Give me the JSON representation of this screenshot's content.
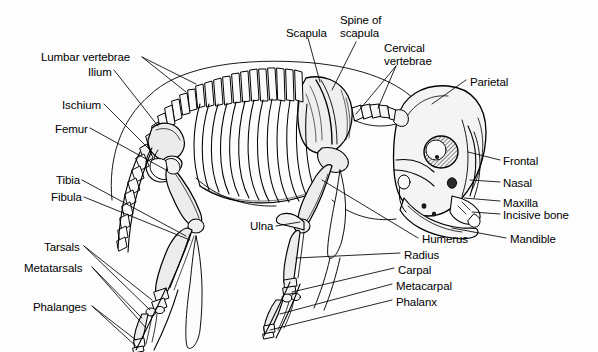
{
  "figure": {
    "view": "lateral-left",
    "background_color": "#fdfdfd",
    "line_color": "#000000",
    "bone_fill_light": "#ffffff",
    "bone_fill_shaded": "#ececec",
    "label_font_size_px": 11.5
  },
  "labels": {
    "lumbar_vertebrae": "Lumbar vertebrae",
    "ilium": "Ilium",
    "ischium": "Ischium",
    "femur": "Femur",
    "tibia": "Tibia",
    "fibula": "Fibula",
    "tarsals": "Tarsals",
    "metatarsals": "Metatarsals",
    "phalanges": "Phalanges",
    "scapula": "Scapula",
    "spine_of_scapula_line1": "Spine of",
    "spine_of_scapula_line2": "scapula",
    "cervical_vertebrae_line1": "Cervical",
    "cervical_vertebrae_line2": "vertebrae",
    "parietal": "Parietal",
    "frontal": "Frontal",
    "nasal": "Nasal",
    "maxilla": "Maxilla",
    "incisive_bone": "Incisive bone",
    "mandible": "Mandible",
    "ulna": "Ulna",
    "humerus": "Humerus",
    "radius": "Radius",
    "carpal": "Carpal",
    "metacarpal": "Metacarpal",
    "phalanx": "Phalanx"
  },
  "label_positions": {
    "lumbar_vertebrae": {
      "x": 41,
      "y": 51,
      "align": "left"
    },
    "ilium": {
      "x": 88,
      "y": 66,
      "align": "left"
    },
    "ischium": {
      "x": 62,
      "y": 99,
      "align": "left"
    },
    "femur": {
      "x": 55,
      "y": 123,
      "align": "left"
    },
    "tibia": {
      "x": 56,
      "y": 174,
      "align": "left"
    },
    "fibula": {
      "x": 51,
      "y": 191,
      "align": "left"
    },
    "tarsals": {
      "x": 44,
      "y": 241,
      "align": "left"
    },
    "metatarsals": {
      "x": 24,
      "y": 262,
      "align": "left"
    },
    "phalanges": {
      "x": 33,
      "y": 301,
      "align": "left"
    },
    "scapula": {
      "x": 286,
      "y": 27,
      "align": "left"
    },
    "spine_of_scapula": {
      "x": 340,
      "y": 14,
      "align": "left"
    },
    "cervical_vertebrae": {
      "x": 384,
      "y": 42,
      "align": "left"
    },
    "parietal": {
      "x": 470,
      "y": 76,
      "align": "left"
    },
    "frontal": {
      "x": 503,
      "y": 155,
      "align": "left"
    },
    "nasal": {
      "x": 503,
      "y": 177,
      "align": "left"
    },
    "maxilla": {
      "x": 503,
      "y": 197,
      "align": "left"
    },
    "incisive_bone": {
      "x": 503,
      "y": 209,
      "align": "left"
    },
    "mandible": {
      "x": 510,
      "y": 233,
      "align": "left"
    },
    "ulna": {
      "x": 250,
      "y": 220,
      "align": "left"
    },
    "humerus": {
      "x": 422,
      "y": 233,
      "align": "left"
    },
    "radius": {
      "x": 404,
      "y": 249,
      "align": "left"
    },
    "carpal": {
      "x": 398,
      "y": 264,
      "align": "left"
    },
    "metacarpal": {
      "x": 396,
      "y": 280,
      "align": "left"
    },
    "phalanx": {
      "x": 396,
      "y": 296,
      "align": "left"
    }
  },
  "bone_groups": [
    {
      "name": "skull",
      "label_refs": [
        "parietal",
        "frontal",
        "nasal",
        "maxilla",
        "incisive_bone",
        "mandible"
      ]
    },
    {
      "name": "vertebral-column",
      "label_refs": [
        "cervical_vertebrae",
        "lumbar_vertebrae"
      ]
    },
    {
      "name": "ribcage",
      "label_refs": []
    },
    {
      "name": "pectoral-girdle",
      "label_refs": [
        "scapula",
        "spine_of_scapula"
      ]
    },
    {
      "name": "forelimb",
      "label_refs": [
        "humerus",
        "radius",
        "ulna",
        "carpal",
        "metacarpal",
        "phalanx"
      ]
    },
    {
      "name": "pelvic-girdle",
      "label_refs": [
        "ilium",
        "ischium"
      ]
    },
    {
      "name": "hindlimb",
      "label_refs": [
        "femur",
        "tibia",
        "fibula",
        "tarsals",
        "metatarsals",
        "phalanges"
      ]
    },
    {
      "name": "tail",
      "label_refs": []
    }
  ]
}
